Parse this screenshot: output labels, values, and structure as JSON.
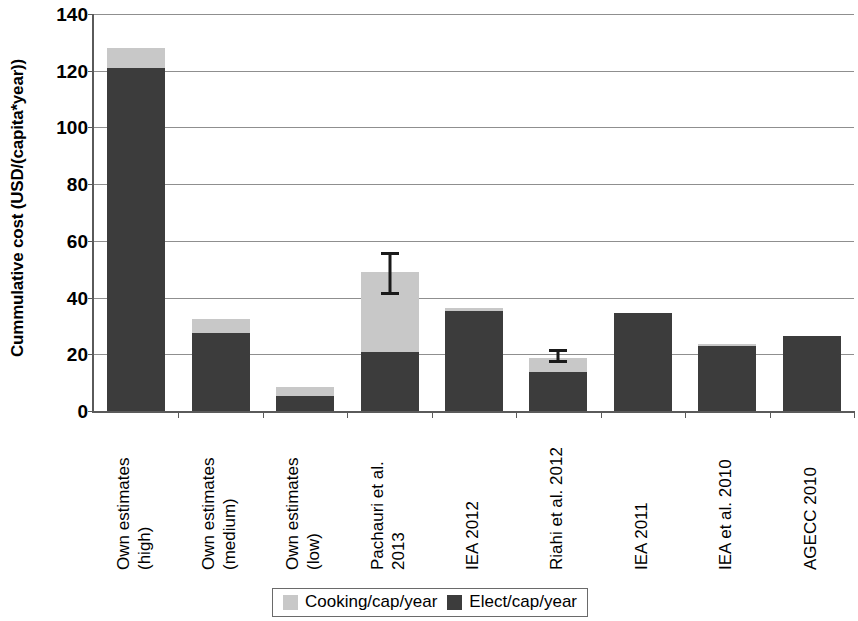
{
  "chart_data": {
    "type": "bar",
    "stacked": true,
    "title": "",
    "xlabel": "",
    "ylabel": "Cummulative cost (USD/(capita*year))",
    "ylim": [
      0,
      140
    ],
    "ytick_step": 20,
    "yticks": [
      "140",
      "120",
      "100",
      "80",
      "60",
      "40",
      "20",
      "0"
    ],
    "grid": true,
    "legend_position": "bottom",
    "categories": [
      "Own estimates (high)",
      "Own estimates (medium)",
      "Own estimates (low)",
      "Pachauri et al. 2013",
      "IEA 2012",
      "Riahi et al. 2012",
      "IEA 2011",
      "IEA et al. 2010",
      "AGECC 2010"
    ],
    "category_lines": [
      [
        "Own estimates",
        "(high)"
      ],
      [
        "Own estimates",
        "(medium)"
      ],
      [
        "Own estimates",
        "(low)"
      ],
      [
        "Pachauri et al.",
        "2013"
      ],
      [
        "IEA 2012",
        ""
      ],
      [
        "Riahi et al. 2012",
        ""
      ],
      [
        "IEA 2011",
        ""
      ],
      [
        "IEA et al. 2010",
        ""
      ],
      [
        "AGECC 2010",
        ""
      ]
    ],
    "series": [
      {
        "name": "Elect/cap/year",
        "color": "#3c3c3c",
        "values": [
          121,
          27.5,
          5.3,
          20.8,
          35.2,
          13.8,
          34.6,
          23.0,
          26.5
        ]
      },
      {
        "name": "Cooking/cap/year",
        "color": "#c8c8c8",
        "values": [
          7,
          4.9,
          3.2,
          28.2,
          1.1,
          4.9,
          0.0,
          0.6,
          0.0
        ]
      }
    ],
    "totals": [
      128,
      32.4,
      8.5,
      49.0,
      36.3,
      18.7,
      34.6,
      23.6,
      26.5
    ],
    "error_bars": [
      null,
      null,
      null,
      {
        "category": "Pachauri et al. 2013",
        "low": 41,
        "high": 56
      },
      null,
      {
        "category": "Riahi et al. 2012",
        "low": 17,
        "high": 22
      },
      null,
      null,
      null
    ]
  },
  "legend": {
    "entries": [
      {
        "label": "Cooking/cap/year",
        "swatch": "cooking"
      },
      {
        "label": "Elect/cap/year",
        "swatch": "elect"
      }
    ]
  },
  "axis": {
    "y_title": "Cummulative cost (USD/(capita*year))"
  }
}
